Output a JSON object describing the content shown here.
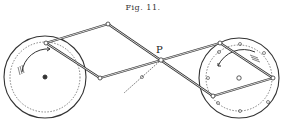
{
  "figure": {
    "title": "Fig. 11.",
    "point_label": "P"
  },
  "left_wheel": {
    "cx": 45,
    "cy": 77,
    "r_outer": 41,
    "r_dashed": 35,
    "rotation": "clockwise"
  },
  "right_wheel": {
    "cx": 239,
    "cy": 78,
    "r_outer": 40,
    "r_dashed": 33,
    "rotation": "counterclockwise"
  },
  "joints": {
    "left_pivot": [
      46,
      43
    ],
    "top_left": [
      108,
      24
    ],
    "bottom_left": [
      100,
      78
    ],
    "P": [
      161,
      60
    ],
    "right_top": [
      220,
      43
    ],
    "right_far": [
      273,
      78
    ],
    "right_bottom": [
      213,
      96
    ]
  },
  "colors": {
    "ink": "#333333",
    "background": "#ffffff"
  }
}
